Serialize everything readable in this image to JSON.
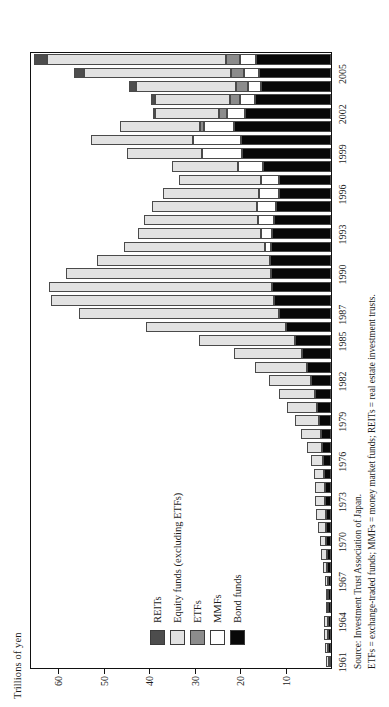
{
  "chart_data": {
    "type": "bar",
    "subtype": "stacked-horizontal",
    "title": "",
    "ylabel": "Trillions of yen",
    "xlabel": "",
    "ylim": [
      0,
      66
    ],
    "yticks": [
      10,
      20,
      30,
      40,
      50,
      60
    ],
    "grid": false,
    "legend_position": "inside-left",
    "categories": [
      "1961",
      "1962",
      "1963",
      "1964",
      "1965",
      "1966",
      "1967",
      "1968",
      "1969",
      "1970",
      "1971",
      "1972",
      "1973",
      "1974",
      "1975",
      "1976",
      "1977",
      "1978",
      "1979",
      "1980",
      "1981",
      "1982",
      "1983",
      "1984",
      "1985",
      "1986",
      "1987",
      "1988",
      "1989",
      "1990",
      "1991",
      "1992",
      "1993",
      "1994",
      "1995",
      "1996",
      "1997",
      "1998",
      "1999",
      "2000",
      "2001",
      "2002",
      "2003",
      "2004",
      "2005",
      "2006"
    ],
    "tick_labels": [
      "1961",
      "1964",
      "1967",
      "1970",
      "1973",
      "1976",
      "1979",
      "1982",
      "1985",
      "1987",
      "1990",
      "1993",
      "1996",
      "1999",
      "2002",
      "2005"
    ],
    "series": [
      {
        "name": "Bond funds",
        "color": "#080808",
        "values": [
          0.5,
          0.6,
          0.7,
          0.7,
          0.6,
          0.6,
          0.7,
          0.8,
          0.9,
          1.0,
          1.1,
          1.2,
          1.3,
          1.4,
          1.5,
          1.7,
          1.9,
          2.2,
          2.6,
          3.1,
          3.6,
          4.3,
          5.2,
          6.4,
          8.0,
          9.8,
          11.5,
          12.6,
          13.0,
          13.3,
          13.5,
          13.3,
          13.0,
          12.6,
          12.1,
          11.4,
          11.5,
          15.0,
          19.5,
          19.9,
          21.4,
          19.0,
          16.8,
          15.3,
          15.8,
          16.6
        ]
      },
      {
        "name": "MMFs",
        "color": "#ffffff",
        "values": [
          0,
          0,
          0,
          0,
          0,
          0,
          0,
          0,
          0,
          0,
          0,
          0,
          0,
          0,
          0,
          0,
          0,
          0,
          0,
          0,
          0,
          0,
          0,
          0,
          0,
          0,
          0,
          0,
          0,
          0,
          0,
          1.2,
          2.5,
          3.5,
          4.2,
          4.5,
          4.0,
          5.5,
          8.8,
          10.5,
          6.5,
          3.8,
          3.2,
          3.0,
          3.3,
          3.4
        ]
      },
      {
        "name": "ETFs",
        "color": "#8c8c8c",
        "values": [
          0,
          0,
          0,
          0,
          0,
          0,
          0,
          0,
          0,
          0,
          0,
          0,
          0,
          0,
          0,
          0,
          0,
          0,
          0,
          0,
          0,
          0,
          0,
          0,
          0,
          0,
          0,
          0,
          0,
          0,
          0,
          0,
          0,
          0,
          0,
          0,
          0,
          0,
          0,
          0,
          1.0,
          1.9,
          2.3,
          2.6,
          2.8,
          3.0
        ]
      },
      {
        "name": "Equity funds (excluding ETFs)",
        "color": "#e2e2e2",
        "values": [
          0.5,
          0.7,
          0.8,
          0.8,
          0.6,
          0.6,
          0.7,
          0.9,
          1.2,
          1.5,
          1.7,
          2.0,
          2.2,
          2.1,
          2.3,
          2.8,
          3.3,
          4.3,
          5.3,
          6.6,
          7.8,
          9.3,
          11.6,
          15.0,
          21.0,
          31.0,
          44.0,
          49.0,
          49.0,
          45.0,
          38.0,
          31.0,
          27.0,
          25.0,
          23.0,
          21.0,
          18.0,
          14.5,
          16.5,
          22.5,
          17.5,
          14.0,
          16.5,
          22.0,
          32.5,
          39.5
        ]
      },
      {
        "name": "REITs",
        "color": "#4d4d4d",
        "values": [
          0,
          0,
          0,
          0,
          0,
          0,
          0,
          0,
          0,
          0,
          0,
          0,
          0,
          0,
          0,
          0,
          0,
          0,
          0,
          0,
          0,
          0,
          0,
          0,
          0,
          0,
          0,
          0,
          0,
          0,
          0,
          0,
          0,
          0,
          0,
          0,
          0,
          0,
          0,
          0,
          0,
          0.3,
          0.9,
          1.5,
          2.2,
          2.8
        ]
      }
    ]
  },
  "legend": {
    "items": [
      {
        "label": "REITs",
        "color": "#4d4d4d"
      },
      {
        "label": "Equity funds (excluding ETFs)",
        "color": "#e2e2e2"
      },
      {
        "label": "ETFs",
        "color": "#8c8c8c"
      },
      {
        "label": "MMFs",
        "color": "#ffffff"
      },
      {
        "label": "Bond funds",
        "color": "#080808"
      }
    ]
  },
  "notes": {
    "source": "Source: Investment Trust Association of Japan.",
    "definitions": "ETFs = exchange-traded funds; MMFs = money market funds; REITs = real estate investment trusts."
  }
}
